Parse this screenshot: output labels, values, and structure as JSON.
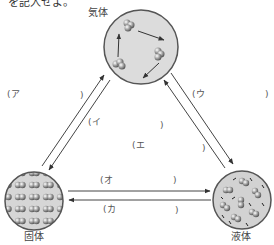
{
  "header": {
    "partial_text": "を記入せよ。"
  },
  "states": {
    "gas": {
      "label": "気体"
    },
    "solid": {
      "label": "固体"
    },
    "liquid": {
      "label": "液体"
    }
  },
  "blanks": {
    "a": {
      "open": "(ア",
      "close": ")"
    },
    "i": {
      "open": "(イ",
      "close": ")"
    },
    "u": {
      "open": "(ウ",
      "close": ")"
    },
    "e": {
      "open": "(エ",
      "close": ")"
    },
    "o": {
      "open": "(オ",
      "close": ")"
    },
    "ka": {
      "open": "(カ",
      "close": ")"
    }
  },
  "colors": {
    "circle_fill": "#d9d9d9",
    "circle_stroke": "#555555",
    "arrow": "#444444",
    "particle": "#8a8a8a"
  }
}
